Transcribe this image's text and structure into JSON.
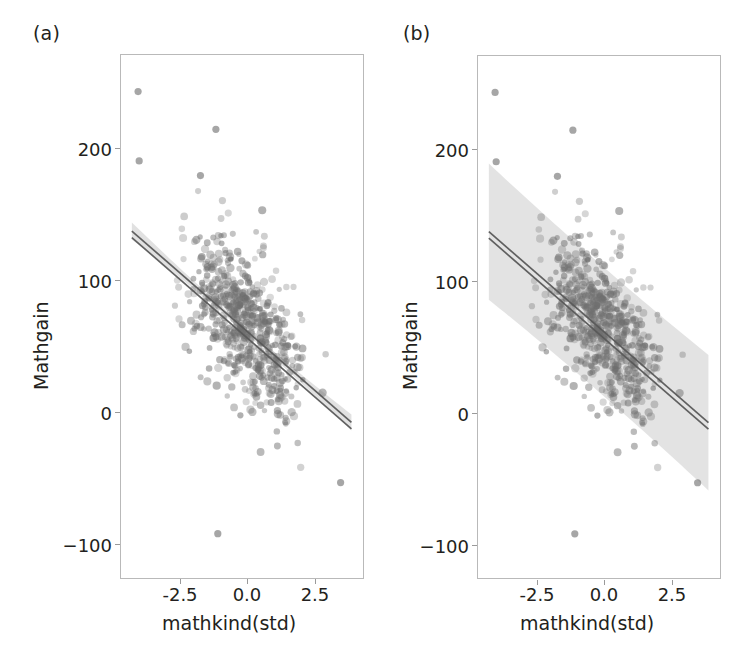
{
  "figure": {
    "panels": [
      {
        "letter": "(a)",
        "name": "confidence-interval-panel",
        "band_type": "confidence",
        "band_label": "confidence interval of the mean"
      },
      {
        "letter": "(b)",
        "name": "prediction-interval-panel",
        "band_type": "prediction",
        "band_label": "prediction interval"
      }
    ]
  },
  "chart_data": [
    {
      "type": "scatter",
      "panel": "(a)",
      "title": "",
      "xlabel": "mathkind(std)",
      "ylabel": "Mathgain",
      "xlim": [
        -4.55,
        4.45
      ],
      "ylim": [
        -148,
        283
      ],
      "xticks": [
        -2.5,
        0.0,
        2.5
      ],
      "xtick_labels": [
        "-2.5",
        "0.0",
        "2.5"
      ],
      "yticks": [
        -100,
        0,
        100,
        200
      ],
      "ytick_labels": [
        "−100",
        "0",
        "100",
        "200"
      ],
      "grid": false,
      "legend": null,
      "point_color": "#6f6f6f",
      "point_opacity": 0.45,
      "point_radius": 3.3,
      "line_color": "#595959",
      "band_color": "#c9c9c9",
      "band_opacity": 0.55,
      "fit": {
        "type": "linear",
        "intercept": 58.0,
        "slope": -19.4,
        "x_start": -4.15,
        "x_end": 3.95,
        "y_start": 138.5,
        "y_end": -18.6
      },
      "band": {
        "kind": "confidence",
        "half_width_at_x_min": 7.0,
        "half_width_at_center": 2.4,
        "half_width_at_x_max": 7.5
      },
      "n_points": 620,
      "notable_points": [
        {
          "x": -3.92,
          "y": 253
        },
        {
          "x": -1.05,
          "y": 222
        },
        {
          "x": -3.88,
          "y": 196
        },
        {
          "x": -1.62,
          "y": 184
        },
        {
          "x": -0.98,
          "y": -110
        },
        {
          "x": 3.55,
          "y": -68
        }
      ]
    },
    {
      "type": "scatter",
      "panel": "(b)",
      "title": "",
      "xlabel": "mathkind(std)",
      "ylabel": "Mathgain",
      "xlim": [
        -4.55,
        4.45
      ],
      "ylim": [
        -148,
        283
      ],
      "xticks": [
        -2.5,
        0.0,
        2.5
      ],
      "xtick_labels": [
        "-2.5",
        "0.0",
        "2.5"
      ],
      "yticks": [
        -100,
        0,
        100,
        200
      ],
      "ytick_labels": [
        "−100",
        "0",
        "100",
        "200"
      ],
      "grid": false,
      "legend": null,
      "point_color": "#6f6f6f",
      "point_opacity": 0.45,
      "point_radius": 3.3,
      "line_color": "#595959",
      "band_color": "#cccccc",
      "band_opacity": 0.55,
      "fit": {
        "type": "linear",
        "intercept": 58.0,
        "slope": -19.4,
        "x_start": -4.15,
        "x_end": 3.95,
        "y_start": 138.5,
        "y_end": -18.6
      },
      "band": {
        "kind": "prediction",
        "half_width_at_x_min": 56.0,
        "half_width_at_center": 53.0,
        "half_width_at_x_max": 56.0
      },
      "n_points": 620,
      "notable_points": [
        {
          "x": -3.92,
          "y": 253
        },
        {
          "x": -1.05,
          "y": 222
        },
        {
          "x": -3.88,
          "y": 196
        },
        {
          "x": -1.62,
          "y": 184
        },
        {
          "x": -0.98,
          "y": -110
        },
        {
          "x": 3.55,
          "y": -68
        }
      ]
    }
  ]
}
